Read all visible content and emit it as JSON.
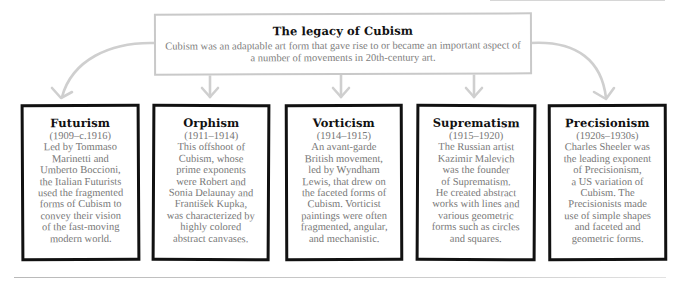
{
  "header": {
    "title": "The legacy of Cubism",
    "description": "Cubism was an adaptable art form that gave rise to or became an important aspect of a number of movements in 20th-century art."
  },
  "movements": [
    {
      "name": "Futurism",
      "dates": "(1909–c.1916)",
      "description": "Led by Tommaso\nMarinetti and\nUmberto Boccioni,\nthe Italian Futurists\nused the fragmented\nforms of Cubism to\nconvey their vision\nof the fast-moving\nmodern world."
    },
    {
      "name": "Orphism",
      "dates": "(1911–1914)",
      "description": "This offshoot of\nCubism, whose\nprime exponents\nwere Robert and\nSonia Delaunay and\nFrantišek Kupka,\nwas characterized by\nhighly colored\nabstract canvases."
    },
    {
      "name": "Vorticism",
      "dates": "(1914–1915)",
      "description": "An avant-garde\nBritish movement,\nled by Wyndham\nLewis, that drew on\nthe faceted forms of\nCubism. Vorticist\npaintings were often\nfragmented, angular,\nand mechanistic."
    },
    {
      "name": "Suprematism",
      "dates": "(1915–1920)",
      "description": "The Russian artist\nKazimir Malevich\nwas the founder\nof Suprematism.\nHe created abstract\nworks with lines and\nvarious geometric\nforms such as circles\nand squares."
    },
    {
      "name": "Precisionism",
      "dates": "(1920s–1930s)",
      "description": "Charles Sheeler was\nthe leading exponent\nof Precisionism,\na US variation of\nCubism. The\nPrecisionists made\nuse of simple shapes\nand faceted and\ngeometric forms."
    }
  ],
  "colors": {
    "card_border": "#111111",
    "header_border": "#c9c9c9",
    "connector": "#cccccc",
    "body_text": "#777777",
    "title_text": "#111111"
  }
}
